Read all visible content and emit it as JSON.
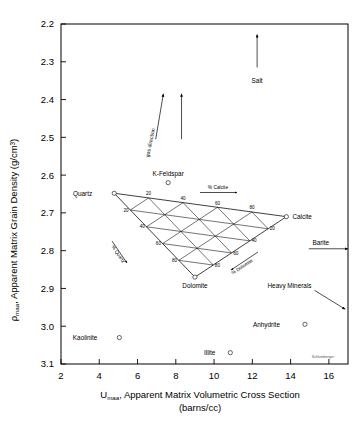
{
  "chart_data": {
    "type": "scatter",
    "title": "",
    "xlabel": "U_maa, Apparent Matrix Volumetric Cross Section (barns/cc)",
    "ylabel": "ρ_maa, Apparent Matrix Grain Density (g/cm3)",
    "xlim": [
      2,
      17
    ],
    "ylim": [
      3.1,
      2.2
    ],
    "y_inverted": true,
    "grid": false,
    "legend": false,
    "xticks": [
      2,
      4,
      6,
      8,
      10,
      12,
      14,
      16
    ],
    "yticks": [
      2.2,
      2.3,
      2.4,
      2.5,
      2.6,
      2.7,
      2.8,
      2.9,
      3.0,
      3.1
    ],
    "points": [
      {
        "name": "Salt",
        "x": 4.65,
        "y": 2.35,
        "marker": "arrow-up",
        "label_dx": 0,
        "label_dy": 0
      },
      {
        "name": "K-Feldspar",
        "x": 7.6,
        "y": 2.62,
        "marker": "circle",
        "label_dx": 0,
        "label_dy": -7
      },
      {
        "name": "Quartz",
        "x": 4.78,
        "y": 2.648,
        "marker": "circle",
        "label_dx": -22,
        "label_dy": 2.5
      },
      {
        "name": "Calcite",
        "x": 13.78,
        "y": 2.71,
        "marker": "circle",
        "label_dx": 6,
        "label_dy": 2.5
      },
      {
        "name": "Dolomite",
        "x": 9.0,
        "y": 2.87,
        "marker": "circle",
        "label_dx": 0,
        "label_dy": 11
      },
      {
        "name": "Kaolinite",
        "x": 5.05,
        "y": 3.03,
        "marker": "circle",
        "label_dx": -22,
        "label_dy": 2.5
      },
      {
        "name": "Illite",
        "x": 10.85,
        "y": 3.07,
        "marker": "circle",
        "label_dx": -15,
        "label_dy": 2.5
      },
      {
        "name": "Anhydrite",
        "x": 14.75,
        "y": 2.995,
        "marker": "circle",
        "label_dx": -25,
        "label_dy": 2.5
      },
      {
        "name": "Barite",
        "x": 17.0,
        "y": 2.795,
        "marker": "arrow-right",
        "label_dx": -16,
        "label_dy": -5
      },
      {
        "name": "Heavy Minerals",
        "x": 17.0,
        "y": 2.935,
        "marker": "arrow-diag",
        "label_dx": -52,
        "label_dy": -10
      }
    ],
    "salt_arrow": {
      "x": 12.25,
      "y_tail": 2.315,
      "y_head": 2.228,
      "label": "Salt",
      "label_x": 12.25,
      "label_y": 2.345
    },
    "gas_direction": {
      "label": "gas direction",
      "arrows": [
        {
          "x_tail": 6.95,
          "y_tail": 2.505,
          "x_head": 7.35,
          "y_head": 2.385
        },
        {
          "x_tail": 8.3,
          "y_tail": 2.505,
          "x_head": 8.3,
          "y_head": 2.385
        }
      ]
    },
    "barite_arrow": {
      "x_tail": 14.95,
      "y": 2.795,
      "x_head": 17.0
    },
    "heavy_minerals_arrow": {
      "x_tail": 15.25,
      "y_tail": 2.905,
      "x_head": 16.85,
      "y_head": 2.955
    },
    "ternary": {
      "vertices": {
        "quartz": {
          "x": 4.78,
          "y": 2.648,
          "label": "Quartz"
        },
        "calcite": {
          "x": 13.78,
          "y": 2.71,
          "label": "Calcite"
        },
        "dolomite": {
          "x": 9.0,
          "y": 2.87,
          "label": "Dolomite"
        }
      },
      "grid_steps": [
        20,
        40,
        60,
        80
      ],
      "axis_labels": [
        {
          "text": "% Calcite",
          "position": "top",
          "arrow": "right"
        },
        {
          "text": "% Quartz",
          "position": "lower-left",
          "arrow": "up-left"
        },
        {
          "text": "% Dolomite",
          "position": "lower-right",
          "arrow": "left-down"
        }
      ],
      "edge_numbers": {
        "calcite_edge": [
          20,
          40,
          60,
          80
        ],
        "quartz_edge": [
          20,
          40,
          60,
          80
        ],
        "dolomite_edge": [
          20,
          40,
          60,
          80
        ]
      }
    },
    "watermark": "Schlumberger"
  },
  "axes": {
    "y_title_main": "Apparent Matrix Grain Density (g/cm",
    "y_title_rho": "ρ",
    "y_title_sub": "maa",
    "y_title_comma": ",",
    "y_title_sup": "3",
    "y_title_close": ")",
    "x_title_u": "U",
    "x_title_sub": "maa",
    "x_title_main": ", Apparent Matrix Volumetric Cross Section",
    "x_title_units": "(barns/cc)"
  }
}
